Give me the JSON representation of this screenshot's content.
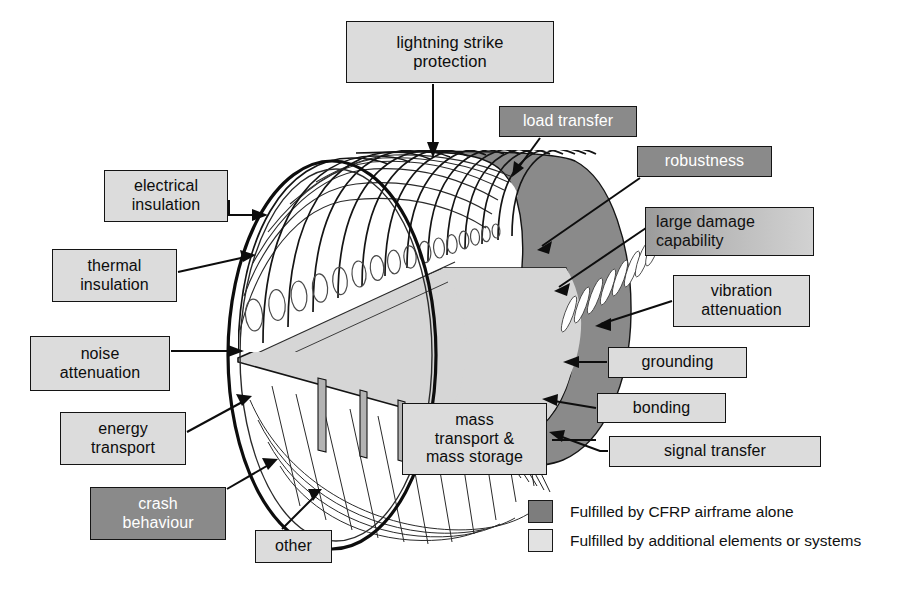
{
  "colors": {
    "dark_fill": "#8a8a8a",
    "light_fill": "#dcdcdc",
    "outline": "#141414",
    "cabin_floor": "#d6d6d6",
    "text_dark": "#0d0d0d",
    "text_light": "#ffffff"
  },
  "callouts": [
    {
      "id": "lightning-strike-protection",
      "label": "lightning strike\nprotection",
      "fill": "light",
      "x": 346,
      "y": 21,
      "w": 208,
      "h": 62,
      "font": 16.5
    },
    {
      "id": "load-transfer",
      "label": "load transfer",
      "fill": "dark",
      "x": 499,
      "y": 106,
      "w": 138,
      "h": 31,
      "font": 16
    },
    {
      "id": "robustness",
      "label": "robustness",
      "fill": "dark",
      "x": 637,
      "y": 146,
      "w": 135,
      "h": 31,
      "font": 16
    },
    {
      "id": "large-damage-capability",
      "label": "large damage\ncapability",
      "fill": "grad",
      "x": 645,
      "y": 207,
      "w": 169,
      "h": 49,
      "font": 16
    },
    {
      "id": "vibration-attenuation",
      "label": "vibration\nattenuation",
      "fill": "light",
      "x": 673,
      "y": 275,
      "w": 137,
      "h": 52,
      "font": 16
    },
    {
      "id": "grounding",
      "label": "grounding",
      "fill": "light",
      "x": 608,
      "y": 347,
      "w": 139,
      "h": 31,
      "font": 16
    },
    {
      "id": "bonding",
      "label": "bonding",
      "fill": "light",
      "x": 597,
      "y": 393,
      "w": 129,
      "h": 30,
      "font": 16
    },
    {
      "id": "signal-transfer",
      "label": "signal transfer",
      "fill": "light",
      "x": 609,
      "y": 436,
      "w": 212,
      "h": 31,
      "font": 16
    },
    {
      "id": "electrical-insulation",
      "label": "electrical\ninsulation",
      "fill": "light",
      "x": 104,
      "y": 170,
      "w": 124,
      "h": 52,
      "font": 16
    },
    {
      "id": "thermal-insulation",
      "label": "thermal\ninsulation",
      "fill": "light",
      "x": 52,
      "y": 249,
      "w": 125,
      "h": 53,
      "font": 16
    },
    {
      "id": "noise-attenuation",
      "label": "noise\nattenuation",
      "fill": "light",
      "x": 30,
      "y": 336,
      "w": 140,
      "h": 55,
      "font": 16
    },
    {
      "id": "energy-transport",
      "label": "energy\ntransport",
      "fill": "light",
      "x": 60,
      "y": 412,
      "w": 126,
      "h": 53,
      "font": 16
    },
    {
      "id": "crash-behaviour",
      "label": "crash\nbehaviour",
      "fill": "dark",
      "x": 90,
      "y": 487,
      "w": 136,
      "h": 53,
      "font": 16
    },
    {
      "id": "other",
      "label": "other",
      "fill": "light",
      "x": 255,
      "y": 530,
      "w": 77,
      "h": 33,
      "font": 16
    },
    {
      "id": "mass-transport-and-mass-storage",
      "label": "mass\ntransport &\nmass storage",
      "fill": "light",
      "x": 402,
      "y": 403,
      "w": 145,
      "h": 72,
      "font": 16
    }
  ],
  "legend": {
    "items": [
      {
        "swatch": "dark",
        "label": "Fulfilled by CFRP airframe alone"
      },
      {
        "swatch": "light",
        "label": "Fulfilled by additional elements or systems"
      }
    ]
  }
}
